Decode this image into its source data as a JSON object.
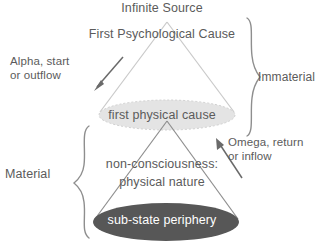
{
  "diagram": {
    "title_top": "Infinite Source",
    "subtitle_top": "First Psychological Cause",
    "middle_node": "first physical cause",
    "lower_text_line1": "non-consciousness:",
    "lower_text_line2": "physical nature",
    "bottom_node": "sub-state periphery",
    "left_arrow_label": "Alpha, start\nor outflow",
    "right_arrow_label": "Omega, return\nor inflow",
    "brace_right_label": "Immaterial",
    "brace_left_label": "Material",
    "colors": {
      "text": "#5b5b5b",
      "stroke": "#8e8e8e",
      "cone_stroke": "#c9c9c9",
      "upper_ellipse_fill": "#e3e3e3",
      "lower_ellipse_fill": "#575757",
      "bottom_label_text": "#ffffff",
      "background": "#ffffff"
    },
    "geometry": {
      "upper_cone_apex": [
        167,
        22
      ],
      "upper_ellipse_center": [
        167,
        115
      ],
      "upper_ellipse_rx": 68,
      "upper_ellipse_ry": 15,
      "lower_cone_apex": [
        167,
        122
      ],
      "lower_ellipse_center": [
        166,
        222
      ],
      "lower_ellipse_rx": 73,
      "lower_ellipse_ry": 19
    }
  }
}
